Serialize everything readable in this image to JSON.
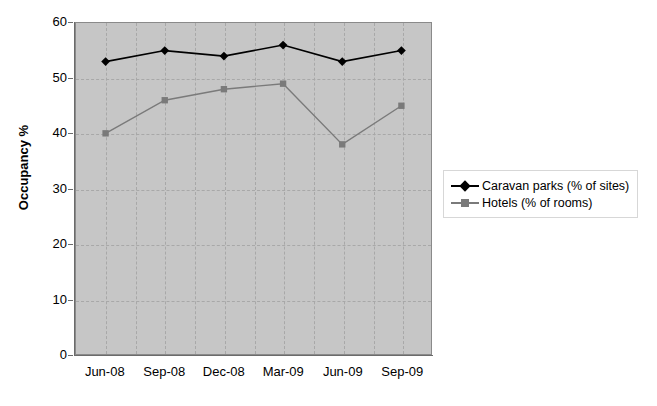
{
  "chart_data": {
    "type": "line",
    "title": "",
    "xlabel": "",
    "ylabel": "Occupancy %",
    "categories": [
      "Jun-08",
      "Sep-08",
      "Dec-08",
      "Mar-09",
      "Jun-09",
      "Sep-09"
    ],
    "ylim": [
      0,
      60
    ],
    "yticks": [
      0,
      10,
      20,
      30,
      40,
      50,
      60
    ],
    "grid": true,
    "legend_position": "right",
    "series": [
      {
        "name": "Caravan parks (% of sites)",
        "values": [
          53,
          55,
          54,
          56,
          53,
          55
        ],
        "color": "#000000",
        "marker": "diamond"
      },
      {
        "name": "Hotels (% of rooms)",
        "values": [
          40,
          46,
          48,
          49,
          38,
          45
        ],
        "color": "#7a7a7a",
        "marker": "square"
      }
    ],
    "plot_background": "#c6c6c6",
    "gridline_color": "#a8a8a8",
    "axis_color": "#6b6b6b",
    "page_background": "#ffffff"
  },
  "yticklabels": [
    "60",
    "50",
    "40",
    "30",
    "20",
    "10",
    "0"
  ]
}
